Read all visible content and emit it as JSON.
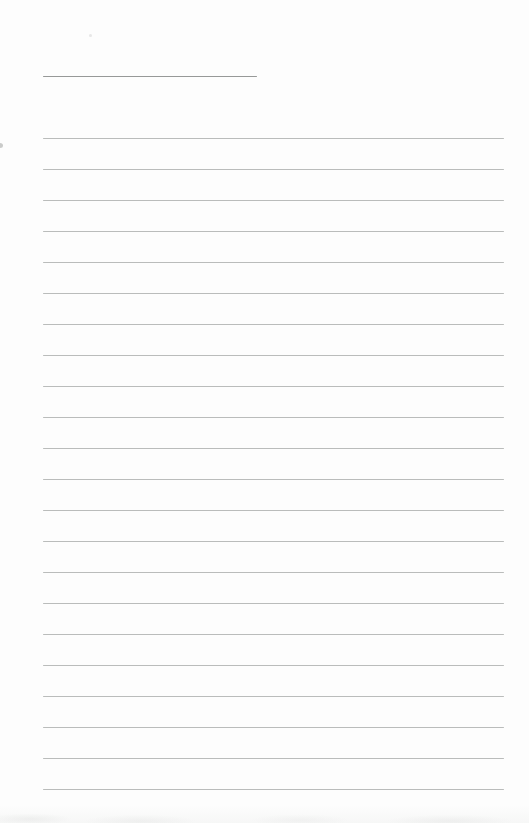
{
  "page": {
    "kind": "blank-lined-paper",
    "background_color": "#fdfdfd",
    "title_line": {
      "x": 43,
      "y": 76,
      "width": 214,
      "color": "#979998",
      "value": ""
    },
    "ruled_lines": {
      "count": 22,
      "x": 43,
      "width": 461,
      "first_y": 138,
      "spacing": 31,
      "color": "#b3b5b4",
      "values": [
        "",
        "",
        "",
        "",
        "",
        "",
        "",
        "",
        "",
        "",
        "",
        "",
        "",
        "",
        "",
        "",
        "",
        "",
        "",
        "",
        "",
        ""
      ]
    }
  }
}
